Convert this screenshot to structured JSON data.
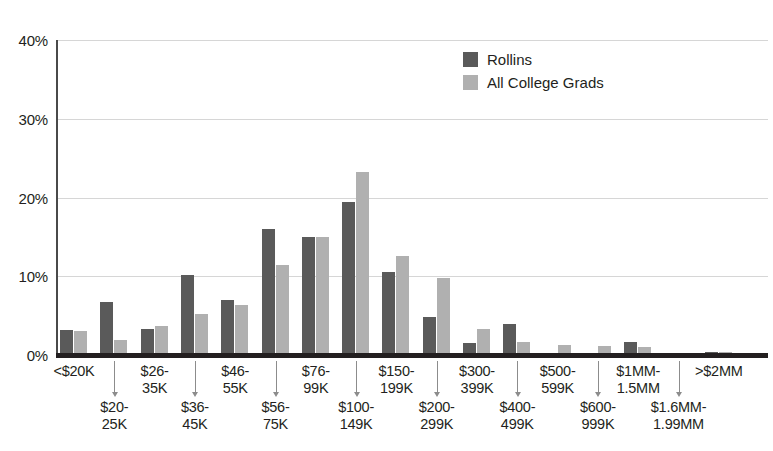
{
  "chart_data": {
    "type": "bar",
    "title": "",
    "subtitle": "",
    "xlabel": "",
    "ylabel": "",
    "ylim": [
      0,
      40
    ],
    "ytick_labels": [
      "0%",
      "10%",
      "20%",
      "30%",
      "40%"
    ],
    "ytick_values": [
      0,
      10,
      20,
      30,
      40
    ],
    "grid": true,
    "legend_position": "top-right",
    "categories": [
      "<$20K",
      "$20-\n25K",
      "$26-\n35K",
      "$36-\n45K",
      "$46-\n55K",
      "$56-\n75K",
      "$76-\n99K",
      "$100-\n149K",
      "$150-\n199K",
      "$200-\n299K",
      "$300-\n399K",
      "$400-\n499K",
      "$500-\n599K",
      "$600-\n999K",
      "$1MM-\n1.5MM",
      "$1.6MM-\n1.99MM",
      ">$2MM"
    ],
    "category_labels": [
      {
        "line1": "<$20K",
        "line2": "",
        "row": "top"
      },
      {
        "line1": "$20-",
        "line2": "25K",
        "row": "bottom"
      },
      {
        "line1": "$26-",
        "line2": "35K",
        "row": "top"
      },
      {
        "line1": "$36-",
        "line2": "45K",
        "row": "bottom"
      },
      {
        "line1": "$46-",
        "line2": "55K",
        "row": "top"
      },
      {
        "line1": "$56-",
        "line2": "75K",
        "row": "bottom"
      },
      {
        "line1": "$76-",
        "line2": "99K",
        "row": "top"
      },
      {
        "line1": "$100-",
        "line2": "149K",
        "row": "bottom"
      },
      {
        "line1": "$150-",
        "line2": "199K",
        "row": "top"
      },
      {
        "line1": "$200-",
        "line2": "299K",
        "row": "bottom"
      },
      {
        "line1": "$300-",
        "line2": "399K",
        "row": "top"
      },
      {
        "line1": "$400-",
        "line2": "499K",
        "row": "bottom"
      },
      {
        "line1": "$500-",
        "line2": "599K",
        "row": "top"
      },
      {
        "line1": "$600-",
        "line2": "999K",
        "row": "bottom"
      },
      {
        "line1": "$1MM-",
        "line2": "1.5MM",
        "row": "top"
      },
      {
        "line1": "$1.6MM-",
        "line2": "1.99MM",
        "row": "bottom"
      },
      {
        "line1": ">$2MM",
        "line2": "",
        "row": "top"
      }
    ],
    "series": [
      {
        "name": "Rollins",
        "color": "#5a5a5a",
        "values": [
          3.2,
          6.7,
          3.3,
          10.2,
          7.0,
          16.0,
          15.0,
          19.4,
          10.6,
          4.8,
          1.5,
          4.0,
          0.3,
          0.3,
          1.7,
          0.2,
          0.4
        ]
      },
      {
        "name": "All College Grads",
        "color": "#b0b0b0",
        "values": [
          3.1,
          1.9,
          3.7,
          5.2,
          6.3,
          11.4,
          15.0,
          23.2,
          12.6,
          9.8,
          3.3,
          1.7,
          1.3,
          1.2,
          1.0,
          0.3,
          0.4
        ]
      }
    ]
  },
  "legend": {
    "items": [
      {
        "label": "Rollins",
        "color": "#5a5a5a"
      },
      {
        "label": "All College Grads",
        "color": "#b0b0b0"
      }
    ]
  },
  "colors": {
    "series_dark": "#5a5a5a",
    "series_light": "#b0b0b0",
    "axis": "#231f20",
    "gridline": "#d6d6d6",
    "background": "#ffffff"
  }
}
